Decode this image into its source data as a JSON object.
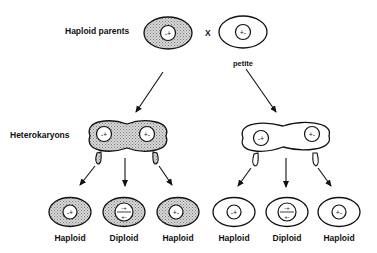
{
  "labels": {
    "haploid_parents": "Haploid parents",
    "cross": "X",
    "petite": "petite",
    "heterokaryons": "Heterokaryons"
  },
  "parents": [
    {
      "nucleus": "-+",
      "shaded": true
    },
    {
      "nucleus": "+-",
      "shaded": false
    }
  ],
  "heterokaryons": [
    {
      "nuclei": [
        "-+",
        "+-"
      ],
      "shaded": true
    },
    {
      "nuclei": [
        "-+",
        "+-"
      ],
      "shaded": false
    }
  ],
  "progeny": [
    {
      "type": "Haploid",
      "nucleus": "-+",
      "shaded": true
    },
    {
      "type": "Diploid",
      "nucleus_top": "-+",
      "nucleus_bottom": "+-",
      "shaded": true
    },
    {
      "type": "Haploid",
      "nucleus": "+-",
      "shaded": true
    },
    {
      "type": "Haploid",
      "nucleus": "-+",
      "shaded": false
    },
    {
      "type": "Diploid",
      "nucleus_top": "-+",
      "nucleus_bottom": "+-",
      "shaded": false
    },
    {
      "type": "Haploid",
      "nucleus": "+-",
      "shaded": false
    }
  ]
}
